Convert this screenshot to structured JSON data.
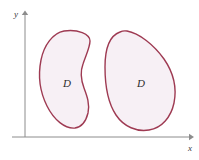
{
  "figure": {
    "background_color": "#ffffff",
    "width": 199,
    "height": 160
  },
  "axes": {
    "color": "#8c8c8c",
    "x_axis": {
      "label": "x",
      "label_x": 190,
      "label_y": 150,
      "start_x": 12,
      "end_x": 191,
      "y": 137,
      "arrow": "right-arrow"
    },
    "y_axis": {
      "label": "y",
      "label_x": 16,
      "label_y": 16,
      "x": 25,
      "start_y": 137,
      "end_y": 13,
      "arrow": "up-arrow"
    },
    "origin": {
      "x": 25,
      "y": 137
    }
  },
  "regions": [
    {
      "name": "left-region",
      "label": "D",
      "label_x": 67,
      "label_y": 87,
      "outline_color": "#9e3a52",
      "fill_color": "#f7f0f5",
      "stroke_width": 1.4,
      "description": "bean shaped region with concave right boundary",
      "path": "M 64 31 C 53 33 44 45 41 60 C 38 75 40 92 47 106 C 54 120 65 129 75 128 C 82 127 86 121 88 113 C 90 104 87 96 84 88 C 81 80 80 72 83 64 C 86 55 90 47 90 41 C 90 34 78 29 64 31 Z"
    },
    {
      "name": "right-region",
      "label": "D",
      "label_x": 141,
      "label_y": 87,
      "outline_color": "#9e3a52",
      "fill_color": "#f7f0f5",
      "stroke_width": 1.4,
      "description": "egg or teardrop shaped region narrower at top",
      "path": "M 120 32 C 109 36 105 50 105 67 C 105 85 108 103 116 115 C 124 127 137 132 149 130 C 162 128 171 117 174 103 C 177 88 173 72 164 59 C 154 45 139 33 127 31 C 124 30.5 122 31 120 32 Z"
    }
  ]
}
